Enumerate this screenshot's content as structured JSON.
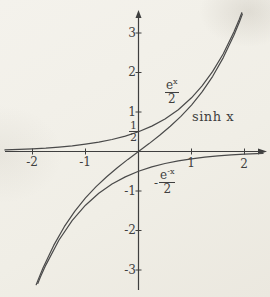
{
  "page": {
    "background_color": "#f1efe8",
    "ink_color": "#3f3f3f",
    "curve_color": "#4a4a4a"
  },
  "chart_data": {
    "type": "line",
    "title": "",
    "xlabel": "",
    "ylabel": "",
    "x_range": [
      -2.52,
      2.42
    ],
    "y_range": [
      -3.55,
      3.6
    ],
    "grid": false,
    "legend_position": "inline-annotations",
    "axes": {
      "x_ticks": [
        {
          "value": -2,
          "label": "-2"
        },
        {
          "value": -1,
          "label": "-1"
        },
        {
          "value": 1,
          "label": "1"
        },
        {
          "value": 2,
          "label": "2"
        }
      ],
      "y_ticks": [
        {
          "value": 3,
          "label": "3"
        },
        {
          "value": 2,
          "label": "2"
        },
        {
          "value": 1,
          "label": "1"
        },
        {
          "value": -1,
          "label": "-1"
        },
        {
          "value": -2,
          "label": "-2"
        },
        {
          "value": -3,
          "label": "-3"
        }
      ]
    },
    "series": [
      {
        "name": "sinh x",
        "color": "#4a4a4a",
        "points": [
          [
            -1.93,
            -3.372
          ],
          [
            -1.9,
            -3.268
          ],
          [
            -1.8,
            -2.942
          ],
          [
            -1.6,
            -2.376
          ],
          [
            -1.4,
            -1.904
          ],
          [
            -1.2,
            -1.509
          ],
          [
            -1.0,
            -1.175
          ],
          [
            -0.8,
            -0.888
          ],
          [
            -0.6,
            -0.637
          ],
          [
            -0.4,
            -0.411
          ],
          [
            -0.2,
            -0.201
          ],
          [
            0,
            0
          ],
          [
            0.2,
            0.201
          ],
          [
            0.4,
            0.411
          ],
          [
            0.6,
            0.637
          ],
          [
            0.8,
            0.888
          ],
          [
            1.0,
            1.175
          ],
          [
            1.2,
            1.509
          ],
          [
            1.4,
            1.904
          ],
          [
            1.6,
            2.376
          ],
          [
            1.8,
            2.942
          ],
          [
            1.9,
            3.268
          ],
          [
            1.96,
            3.479
          ]
        ]
      },
      {
        "name": "e^x/2",
        "color": "#4a4a4a",
        "points": [
          [
            -2.52,
            0.04
          ],
          [
            -2.25,
            0.053
          ],
          [
            -2.0,
            0.068
          ],
          [
            -1.75,
            0.087
          ],
          [
            -1.5,
            0.112
          ],
          [
            -1.25,
            0.143
          ],
          [
            -1.0,
            0.184
          ],
          [
            -0.75,
            0.236
          ],
          [
            -0.5,
            0.303
          ],
          [
            -0.25,
            0.389
          ],
          [
            0,
            0.5
          ],
          [
            0.25,
            0.642
          ],
          [
            0.5,
            0.824
          ],
          [
            0.75,
            1.059
          ],
          [
            1.0,
            1.359
          ],
          [
            1.2,
            1.66
          ],
          [
            1.4,
            2.028
          ],
          [
            1.6,
            2.476
          ],
          [
            1.8,
            3.025
          ],
          [
            1.9,
            3.343
          ],
          [
            1.95,
            3.514
          ]
        ]
      },
      {
        "name": "-e^-x/2",
        "color": "#4a4a4a",
        "points": [
          [
            -1.9,
            -3.343
          ],
          [
            -1.85,
            -3.18
          ],
          [
            -1.75,
            -2.877
          ],
          [
            -1.5,
            -2.241
          ],
          [
            -1.25,
            -1.745
          ],
          [
            -1.0,
            -1.359
          ],
          [
            -0.75,
            -1.059
          ],
          [
            -0.5,
            -0.824
          ],
          [
            -0.25,
            -0.642
          ],
          [
            0,
            -0.5
          ],
          [
            0.25,
            -0.389
          ],
          [
            0.5,
            -0.303
          ],
          [
            0.75,
            -0.236
          ],
          [
            1.0,
            -0.184
          ],
          [
            1.25,
            -0.143
          ],
          [
            1.5,
            -0.112
          ],
          [
            1.75,
            -0.087
          ],
          [
            2.0,
            -0.068
          ],
          [
            2.35,
            -0.048
          ]
        ]
      }
    ]
  },
  "labels": {
    "sinh": "sinh x",
    "ex_base": "e",
    "ex_sup": "x",
    "ex_den": "2",
    "negex_minus": "-",
    "negex_base": "e",
    "negex_sup": "-x",
    "negex_den": "2",
    "half_num": "1",
    "half_den": "2"
  }
}
